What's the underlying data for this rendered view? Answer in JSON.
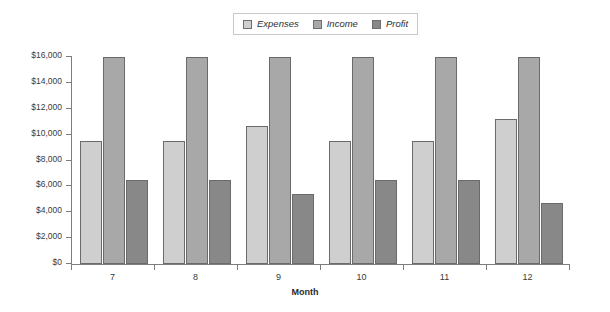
{
  "chart_data": {
    "type": "bar",
    "title": "",
    "xlabel": "Month",
    "ylabel": "",
    "categories": [
      "7",
      "8",
      "9",
      "10",
      "11",
      "12"
    ],
    "series": [
      {
        "name": "Expenses",
        "color": "#cfcfcf",
        "values": [
          9500,
          9500,
          10700,
          9500,
          9500,
          11200
        ]
      },
      {
        "name": "Income",
        "color": "#a8a8a8",
        "values": [
          16000,
          16000,
          16000,
          16000,
          16000,
          16000
        ]
      },
      {
        "name": "Profit",
        "color": "#888888",
        "values": [
          6500,
          6500,
          5400,
          6500,
          6500,
          4700
        ]
      }
    ],
    "ylim": [
      0,
      16000
    ],
    "ytick_values": [
      0,
      2000,
      4000,
      6000,
      8000,
      10000,
      12000,
      14000,
      16000
    ],
    "ytick_labels": [
      "$0",
      "$2,000",
      "$4,000",
      "$6,000",
      "$8,000",
      "$10,000",
      "$12,000",
      "$14,000",
      "$16,000"
    ],
    "grid": false,
    "legend_position": "top-center"
  },
  "legend": {
    "items": [
      {
        "label": "Expenses",
        "color": "#cfcfcf"
      },
      {
        "label": "Income",
        "color": "#a8a8a8"
      },
      {
        "label": "Profit",
        "color": "#888888"
      }
    ]
  },
  "axis": {
    "x_title": "Month"
  }
}
